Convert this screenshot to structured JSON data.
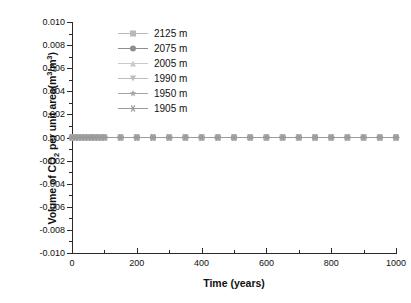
{
  "chart_data": {
    "type": "line",
    "title": "",
    "xlabel": "Time (years)",
    "ylabel_parts": {
      "pre": "Volume of CO",
      "sub1": "2",
      "mid": " per unit area(m",
      "sup1": "3",
      "mid2": "/m",
      "sup2": "3",
      "post": ")"
    },
    "ylabel": "Volume of CO2 per unit area(m3/m3)",
    "xlim": [
      0,
      1000
    ],
    "ylim": [
      -0.01,
      0.01
    ],
    "grid": false,
    "legend_position": "top-center",
    "x_ticks": [
      0,
      200,
      400,
      600,
      800,
      1000
    ],
    "x_tick_labels": [
      "0",
      "200",
      "400",
      "600",
      "800",
      "1000"
    ],
    "x_minor_step": 100,
    "y_ticks": [
      -0.01,
      -0.008,
      -0.006,
      -0.004,
      -0.002,
      0.0,
      0.002,
      0.004,
      0.006,
      0.008,
      0.01
    ],
    "y_tick_labels": [
      "-0.010",
      "-0.008",
      "-0.006",
      "-0.004",
      "-0.002",
      "0.000",
      "0.002",
      "0.004",
      "0.006",
      "0.008",
      "0.010"
    ],
    "y_minor_step": 0.001,
    "x": [
      0,
      10,
      20,
      30,
      40,
      50,
      60,
      70,
      80,
      90,
      100,
      150,
      200,
      250,
      300,
      350,
      400,
      450,
      500,
      550,
      600,
      650,
      700,
      750,
      800,
      850,
      900,
      950,
      1000
    ],
    "series": [
      {
        "name": "2125 m",
        "marker": "square",
        "color": "#b9b9b9",
        "values": [
          0,
          0,
          0,
          0,
          0,
          0,
          0,
          0,
          0,
          0,
          0,
          0,
          0,
          0,
          0,
          0,
          0,
          0,
          0,
          0,
          0,
          0,
          0,
          0,
          0,
          0,
          0,
          0,
          0
        ]
      },
      {
        "name": "2075 m",
        "marker": "circle",
        "color": "#8e8e8e",
        "values": [
          0,
          0,
          0,
          0,
          0,
          0,
          0,
          0,
          0,
          0,
          0,
          0,
          0,
          0,
          0,
          0,
          0,
          0,
          0,
          0,
          0,
          0,
          0,
          0,
          0,
          0,
          0,
          0,
          0
        ]
      },
      {
        "name": "2005 m",
        "marker": "triangle-up",
        "color": "#c9c9c9",
        "values": [
          0,
          0,
          0,
          0,
          0,
          0,
          0,
          0,
          0,
          0,
          0,
          0,
          0,
          0,
          0,
          0,
          0,
          0,
          0,
          0,
          0,
          0,
          0,
          0,
          0,
          0,
          0,
          0,
          0
        ]
      },
      {
        "name": "1990 m",
        "marker": "triangle-down",
        "color": "#bdbdbd",
        "values": [
          0,
          0,
          0,
          0,
          0,
          0,
          0,
          0,
          0,
          0,
          0,
          0,
          0,
          0,
          0,
          0,
          0,
          0,
          0,
          0,
          0,
          0,
          0,
          0,
          0,
          0,
          0,
          0,
          0
        ]
      },
      {
        "name": "1950 m",
        "marker": "star",
        "color": "#a6a6a6",
        "values": [
          0,
          0,
          0,
          0,
          0,
          0,
          0,
          0,
          0,
          0,
          0,
          0,
          0,
          0,
          0,
          0,
          0,
          0,
          0,
          0,
          0,
          0,
          0,
          0,
          0,
          0,
          0,
          0,
          0
        ]
      },
      {
        "name": "1905 m",
        "marker": "asterisk",
        "color": "#9a9a9a",
        "values": [
          0,
          0,
          0,
          0,
          0,
          0,
          0,
          0,
          0,
          0,
          0,
          0,
          0,
          0,
          0,
          0,
          0,
          0,
          0,
          0,
          0,
          0,
          0,
          0,
          0,
          0,
          0,
          0,
          0
        ]
      }
    ]
  }
}
